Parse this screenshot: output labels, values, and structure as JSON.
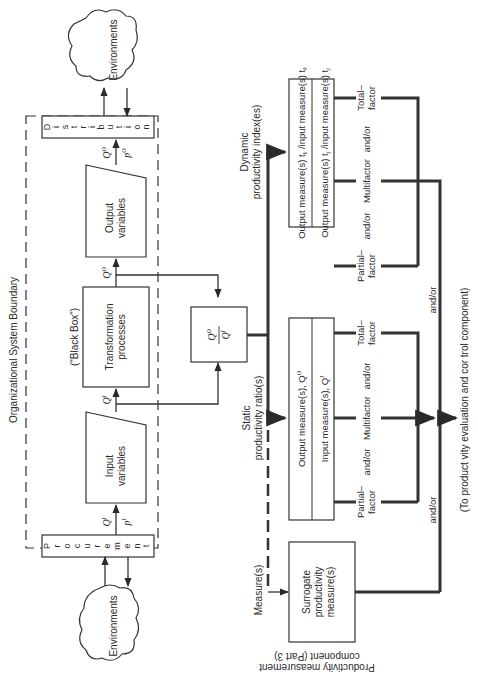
{
  "diagram": {
    "orientation": "rotated 90° counter-clockwise (page read by turning clockwise)",
    "boundary_label": "Organizational System Boundary",
    "black_box_label": "(\"Black Box\")",
    "environments_top": "Environments",
    "environments_bottom": "Environments",
    "procurement_letters": [
      "P",
      "r",
      "o",
      "c",
      "u",
      "r",
      "e",
      "m",
      "e",
      "n",
      "t"
    ],
    "distribution_letters": [
      "D",
      "i",
      "s",
      "t",
      "r",
      "i",
      "b",
      "u",
      "t",
      "i",
      "o",
      "n"
    ],
    "input_box": {
      "line1": "Input",
      "line2": "variables"
    },
    "transformation_box": {
      "line1": "Transformation",
      "line2": "processes"
    },
    "output_box": {
      "line1": "Output",
      "line2": "variables"
    },
    "flow_labels": {
      "q_in_top": "Q",
      "q_in_sup": "I",
      "q_in_sub": "i",
      "p_in": "p",
      "p_in_sup": "I",
      "p_in_sub": "i",
      "q_out": "Q",
      "q_out_sup": "O",
      "q_out_sub": "i",
      "p_out": "p",
      "p_out_sup": "O",
      "p_out_sub": "i"
    },
    "ratio_box": {
      "numerator": "Q",
      "numerator_sup": "O",
      "denominator": "Q",
      "denominator_sup": "I",
      "sub": "i"
    },
    "static_label": {
      "line1": "Static",
      "line2": "productivity ratio(s)"
    },
    "dynamic_label": {
      "line1": "Dynamic",
      "line2": "productivity index(es)"
    },
    "measures_label": "Measure(s)",
    "static_box": {
      "row1": "Output measure(s), Q",
      "row1_sup": "O",
      "row1_sub": "i",
      "row2": "Input measure(s), Q",
      "row2_sup": "I",
      "row2_sub": "i"
    },
    "dynamic_box": {
      "row1": "Output measure(s) t",
      "row1_sub": "k",
      "row1_mid": " /input measure(s) t",
      "row1_sub2": "k",
      "row2": "Output measure(s) t",
      "row2_sub": "j",
      "row2_mid": " /input measure(s) t",
      "row2_sub2": "j"
    },
    "surrogate_box": {
      "line1": "Surrogate",
      "line2": "productivity",
      "line3": "measure(s)"
    },
    "factor_labels": {
      "partial": [
        "Partial–",
        "factor"
      ],
      "multifactor": "Multifactor",
      "total": [
        "Total–",
        "factor"
      ],
      "and_or": "and/or"
    },
    "destination_label": "(To product vity evaluation and cor trol component)",
    "component_label": {
      "line1": "Productivity measurement",
      "line2": "component (Part 3)"
    }
  }
}
